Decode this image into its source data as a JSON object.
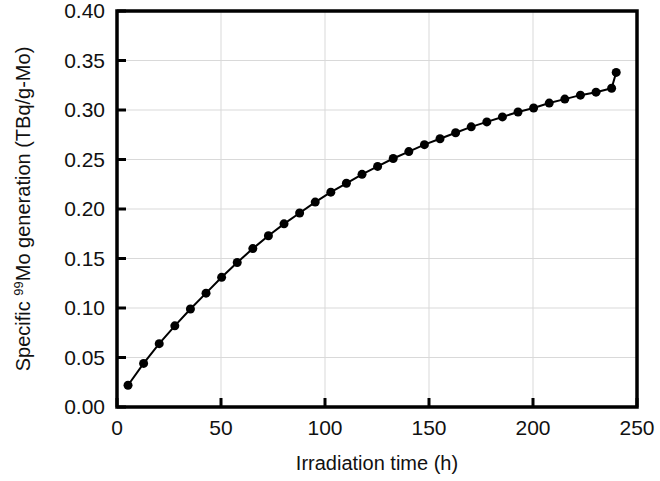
{
  "chart_data": {
    "type": "line",
    "title": "",
    "subtitle": "",
    "xlabel": "Irradiation time (h)",
    "ylabel_parts": {
      "pre": "Specific ",
      "sup": "99",
      "post": "Mo generation (TBq/g-Mo)"
    },
    "ylabel": "Specific 99Mo generation (TBq/g-Mo)",
    "xlim": [
      0,
      250
    ],
    "ylim": [
      0.0,
      0.4
    ],
    "xticks": [
      0,
      50,
      100,
      150,
      200,
      250
    ],
    "xtick_labels": [
      "0",
      "50",
      "100",
      "150",
      "200",
      "250"
    ],
    "yticks": [
      0.0,
      0.05,
      0.1,
      0.15,
      0.2,
      0.25,
      0.3,
      0.35,
      0.4
    ],
    "ytick_labels": [
      "0.00",
      "0.05",
      "0.10",
      "0.15",
      "0.20",
      "0.25",
      "0.30",
      "0.35",
      "0.40"
    ],
    "grid": true,
    "grid_color": "#d9d9d9",
    "legend": null,
    "marker": "circle-filled",
    "marker_color": "#000000",
    "marker_size": 9,
    "line_color": "#000000",
    "line_width": 2,
    "axis_color": "#000000",
    "series": [
      {
        "name": "Specific 99Mo generation",
        "x": [
          5.3,
          12.8,
          20.3,
          27.8,
          35.3,
          42.8,
          50.3,
          57.8,
          65.3,
          72.8,
          80.3,
          87.8,
          95.3,
          102.8,
          110.3,
          117.8,
          125.3,
          132.8,
          140.3,
          147.8,
          155.3,
          162.8,
          170.3,
          177.8,
          185.3,
          192.8,
          200.3,
          207.8,
          215.3,
          222.8,
          230.3,
          237.8
        ],
        "values": [
          0.022,
          0.044,
          0.064,
          0.082,
          0.099,
          0.115,
          0.131,
          0.146,
          0.16,
          0.173,
          0.185,
          0.196,
          0.207,
          0.217,
          0.226,
          0.235,
          0.243,
          0.251,
          0.258,
          0.265,
          0.271,
          0.277,
          0.283,
          0.288,
          0.293,
          0.298,
          0.302,
          0.307,
          0.311,
          0.315,
          0.318,
          0.322
        ]
      }
    ],
    "series_extra_x": [
      240.0
    ],
    "series_extra_values": [
      0.338
    ]
  },
  "figure": {
    "background": "#ffffff",
    "plot_left": 117,
    "plot_top": 11,
    "plot_right": 637,
    "plot_bottom": 407
  }
}
